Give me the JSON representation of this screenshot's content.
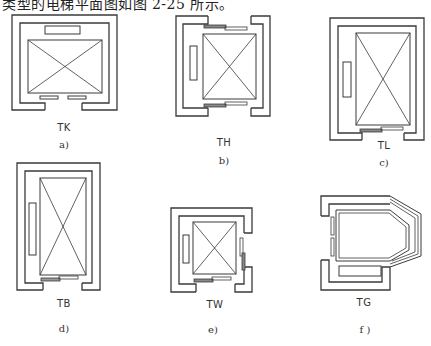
{
  "caption_top": "类型的电梯平面图如图 2-25 所示。",
  "colors": {
    "line": "#3a3a3a",
    "thin_line": "#555555",
    "background": "#ffffff"
  },
  "panels": [
    {
      "id": "a",
      "code": "TK",
      "sub_label": "a)"
    },
    {
      "id": "b",
      "code": "TH",
      "sub_label": "b)"
    },
    {
      "id": "c",
      "code": "TL",
      "sub_label": "c)"
    },
    {
      "id": "d",
      "code": "TB",
      "sub_label": "d)"
    },
    {
      "id": "e",
      "code": "TW",
      "sub_label": "e)"
    },
    {
      "id": "f",
      "code": "TG",
      "sub_label": "f )"
    }
  ]
}
